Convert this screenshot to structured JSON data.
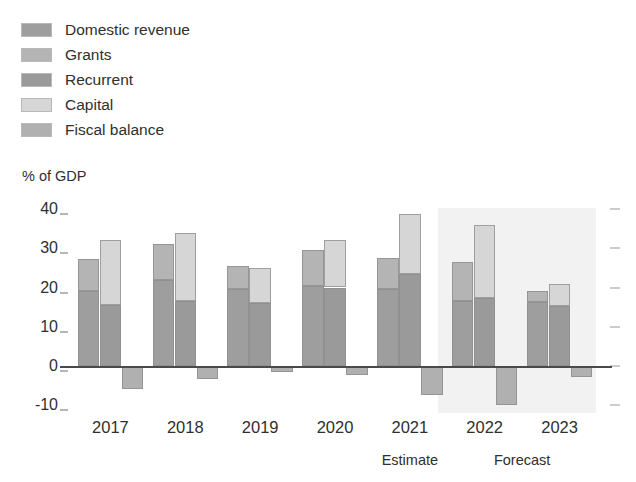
{
  "legend": {
    "items": [
      {
        "label": "Domestic revenue",
        "color": "#9e9e9e"
      },
      {
        "label": "Grants",
        "color": "#b4b4b4"
      },
      {
        "label": "Recurrent",
        "color": "#9a9a9a"
      },
      {
        "label": "Capital",
        "color": "#d6d6d6"
      },
      {
        "label": "Fiscal balance",
        "color": "#b0b0b0"
      }
    ]
  },
  "chart_data": {
    "type": "bar",
    "title": "",
    "subtitle": "",
    "xlabel": "",
    "ylabel": "% of GDP",
    "categories": [
      "2017",
      "2018",
      "2019",
      "2020",
      "2021",
      "2022",
      "2023"
    ],
    "ytick_labels": [
      "40",
      "30",
      "20",
      "10",
      "0",
      "-10"
    ],
    "ytick_values": [
      40,
      30,
      20,
      10,
      0,
      -10
    ],
    "ylim": [
      -12,
      42
    ],
    "grid": false,
    "legend_position": "top-left",
    "series": [
      {
        "name": "Domestic revenue",
        "color": "#9e9e9e",
        "group": "revenue",
        "stack_order": 0,
        "values": [
          19.0,
          22.0,
          19.7,
          20.4,
          19.6,
          16.5,
          16.2
        ]
      },
      {
        "name": "Grants",
        "color": "#b4b4b4",
        "group": "revenue",
        "stack_order": 1,
        "values": [
          8.3,
          9.0,
          5.8,
          9.1,
          7.9,
          9.9,
          2.8
        ]
      },
      {
        "name": "Recurrent",
        "color": "#9a9a9a",
        "group": "expenditure",
        "stack_order": 0,
        "values": [
          15.5,
          16.6,
          16.0,
          20.0,
          23.5,
          17.3,
          15.3
        ]
      },
      {
        "name": "Capital",
        "color": "#d6d6d6",
        "group": "expenditure",
        "stack_order": 1,
        "values": [
          16.5,
          17.2,
          9.0,
          12.0,
          15.2,
          18.7,
          5.7
        ]
      },
      {
        "name": "Fiscal balance",
        "color": "#b0b0b0",
        "group": "balance",
        "stack_order": 0,
        "values": [
          -5.8,
          -3.2,
          -1.5,
          -2.3,
          -7.5,
          -10.0,
          -2.8
        ]
      }
    ],
    "totals": {
      "revenue_plus_grants": [
        27.3,
        31.0,
        25.5,
        29.5,
        27.5,
        26.4,
        19.0
      ],
      "total_expenditure": [
        32.0,
        33.8,
        25.0,
        32.0,
        38.7,
        36.0,
        21.0
      ]
    },
    "annotations": [
      {
        "text": "Estimate",
        "category": "2021"
      },
      {
        "text": "Forecast",
        "category_span": [
          "2022",
          "2023"
        ]
      }
    ],
    "shaded_region": {
      "label": "Forecast",
      "from_category": "2022",
      "to_category": "2023",
      "color": "#f2f2f2"
    }
  }
}
